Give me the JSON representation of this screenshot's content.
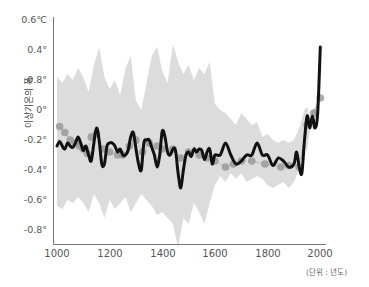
{
  "chart_data": {
    "type": "line",
    "title": "",
    "xlabel": "",
    "ylabel": "이상기온의 폭",
    "unit_note": "(단위 : 년도)",
    "xlim": [
      1000,
      2000
    ],
    "ylim": [
      -0.8,
      0.6
    ],
    "x_ticks": [
      "1000",
      "1200",
      "1400",
      "1600",
      "1800",
      "2000"
    ],
    "y_ticks": [
      "0.6℃",
      "0.4°",
      "0.8°",
      "0°",
      "-0.2°",
      "-0.4°",
      "-0.6°",
      "-0.8°"
    ],
    "y_tick_values": [
      0.6,
      0.4,
      0.2,
      0,
      -0.2,
      -0.4,
      -0.6,
      -0.8
    ],
    "grid": false,
    "legend": null,
    "series": [
      {
        "name": "uncertainty band (upper)",
        "kind": "area-upper",
        "x": [
          1000,
          1020,
          1040,
          1060,
          1080,
          1100,
          1120,
          1140,
          1160,
          1180,
          1200,
          1220,
          1240,
          1260,
          1280,
          1300,
          1320,
          1340,
          1360,
          1380,
          1400,
          1420,
          1440,
          1460,
          1480,
          1500,
          1520,
          1540,
          1560,
          1580,
          1600,
          1620,
          1640,
          1660,
          1680,
          1700,
          1720,
          1740,
          1760,
          1780,
          1800,
          1820,
          1840,
          1860,
          1880,
          1900,
          1920,
          1940,
          1950,
          1960,
          1980,
          2000
        ],
        "values": [
          0.22,
          0.18,
          0.24,
          0.2,
          0.28,
          0.22,
          0.12,
          0.3,
          0.42,
          0.22,
          0.14,
          0.2,
          0.1,
          0.28,
          0.36,
          0.06,
          0.0,
          0.18,
          0.36,
          0.42,
          0.26,
          0.18,
          0.44,
          0.32,
          0.24,
          0.3,
          0.2,
          0.28,
          0.24,
          0.32,
          0.04,
          0.0,
          -0.02,
          -0.06,
          -0.1,
          -0.02,
          -0.06,
          -0.1,
          -0.08,
          -0.18,
          -0.16,
          -0.2,
          -0.22,
          -0.2,
          -0.22,
          -0.2,
          -0.12,
          0.0,
          0.02,
          -0.04,
          0.02,
          0.1
        ]
      },
      {
        "name": "uncertainty band (lower)",
        "kind": "area-lower",
        "x": [
          1000,
          1020,
          1040,
          1060,
          1080,
          1100,
          1120,
          1140,
          1160,
          1180,
          1200,
          1220,
          1240,
          1260,
          1280,
          1300,
          1320,
          1340,
          1360,
          1380,
          1400,
          1420,
          1440,
          1460,
          1480,
          1500,
          1520,
          1540,
          1560,
          1580,
          1600,
          1620,
          1640,
          1660,
          1680,
          1700,
          1720,
          1740,
          1760,
          1780,
          1800,
          1820,
          1840,
          1860,
          1880,
          1900,
          1920,
          1940,
          1950,
          1960,
          1980,
          2000
        ],
        "values": [
          -0.64,
          -0.66,
          -0.6,
          -0.62,
          -0.58,
          -0.62,
          -0.68,
          -0.56,
          -0.62,
          -0.72,
          -0.6,
          -0.66,
          -0.62,
          -0.58,
          -0.68,
          -0.62,
          -0.56,
          -0.6,
          -0.64,
          -0.7,
          -0.68,
          -0.72,
          -0.76,
          -0.92,
          -0.72,
          -0.76,
          -0.62,
          -0.68,
          -0.76,
          -0.62,
          -0.5,
          -0.44,
          -0.48,
          -0.42,
          -0.46,
          -0.42,
          -0.48,
          -0.46,
          -0.44,
          -0.46,
          -0.5,
          -0.52,
          -0.5,
          -0.48,
          -0.52,
          -0.48,
          -0.4,
          -0.24,
          -0.28,
          -0.14,
          -0.1,
          0.2
        ]
      },
      {
        "name": "reconstruction (black line)",
        "kind": "line",
        "color": "#111111",
        "x": [
          1000,
          1010,
          1020,
          1030,
          1040,
          1050,
          1060,
          1070,
          1080,
          1090,
          1100,
          1110,
          1120,
          1130,
          1140,
          1150,
          1160,
          1170,
          1180,
          1190,
          1200,
          1210,
          1220,
          1230,
          1240,
          1250,
          1260,
          1270,
          1280,
          1290,
          1300,
          1310,
          1320,
          1330,
          1340,
          1350,
          1360,
          1370,
          1380,
          1390,
          1400,
          1410,
          1420,
          1430,
          1440,
          1450,
          1460,
          1470,
          1480,
          1490,
          1500,
          1510,
          1520,
          1530,
          1540,
          1550,
          1560,
          1570,
          1580,
          1590,
          1600,
          1620,
          1640,
          1660,
          1680,
          1700,
          1720,
          1740,
          1760,
          1780,
          1800,
          1820,
          1840,
          1860,
          1880,
          1900,
          1910,
          1920,
          1930,
          1940,
          1950,
          1960,
          1970,
          1980,
          1990,
          2000
        ],
        "values": [
          -0.24,
          -0.21,
          -0.24,
          -0.26,
          -0.22,
          -0.24,
          -0.25,
          -0.22,
          -0.18,
          -0.22,
          -0.27,
          -0.24,
          -0.3,
          -0.34,
          -0.22,
          -0.12,
          -0.2,
          -0.36,
          -0.36,
          -0.24,
          -0.22,
          -0.22,
          -0.24,
          -0.28,
          -0.26,
          -0.3,
          -0.3,
          -0.27,
          -0.18,
          -0.15,
          -0.26,
          -0.36,
          -0.4,
          -0.22,
          -0.2,
          -0.2,
          -0.25,
          -0.3,
          -0.38,
          -0.3,
          -0.14,
          -0.18,
          -0.28,
          -0.3,
          -0.26,
          -0.27,
          -0.42,
          -0.52,
          -0.4,
          -0.3,
          -0.28,
          -0.31,
          -0.26,
          -0.28,
          -0.26,
          -0.27,
          -0.33,
          -0.28,
          -0.26,
          -0.36,
          -0.3,
          -0.3,
          -0.22,
          -0.3,
          -0.36,
          -0.34,
          -0.3,
          -0.3,
          -0.22,
          -0.3,
          -0.3,
          -0.37,
          -0.32,
          -0.34,
          -0.38,
          -0.36,
          -0.28,
          -0.38,
          -0.42,
          -0.2,
          -0.04,
          -0.12,
          -0.04,
          -0.12,
          -0.02,
          0.42
        ]
      },
      {
        "name": "proxy samples (gray dots)",
        "kind": "scatter",
        "color": "#9a9a9a",
        "x": [
          1010,
          1030,
          1050,
          1070,
          1085,
          1100,
          1115,
          1130,
          1150,
          1175,
          1200,
          1230,
          1250,
          1275,
          1300,
          1325,
          1350,
          1380,
          1400,
          1440,
          1470,
          1500,
          1540,
          1570,
          1600,
          1640,
          1670,
          1700,
          1740,
          1790,
          1850,
          1880,
          1920,
          1950,
          1975,
          2000
        ],
        "values": [
          -0.11,
          -0.15,
          -0.2,
          -0.22,
          -0.24,
          -0.26,
          -0.29,
          -0.18,
          -0.16,
          -0.26,
          -0.28,
          -0.3,
          -0.3,
          -0.24,
          -0.2,
          -0.28,
          -0.22,
          -0.24,
          -0.26,
          -0.26,
          -0.32,
          -0.28,
          -0.3,
          -0.32,
          -0.34,
          -0.38,
          -0.36,
          -0.34,
          -0.34,
          -0.36,
          -0.38,
          -0.37,
          -0.38,
          -0.1,
          -0.02,
          0.08
        ]
      }
    ]
  }
}
